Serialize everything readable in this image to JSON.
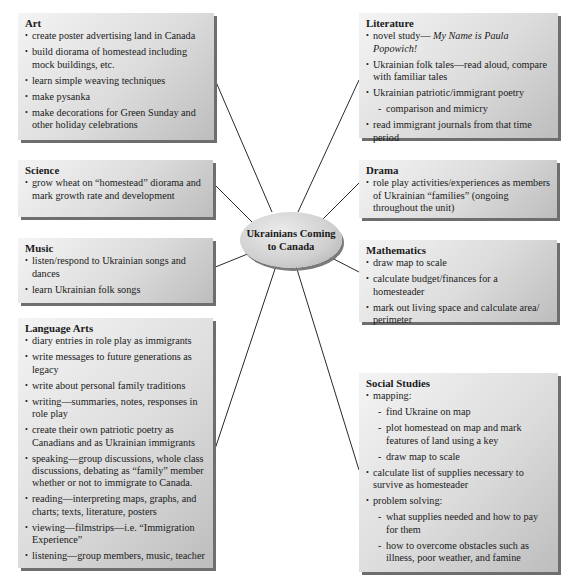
{
  "center": {
    "title": "Ukrainians Coming to Canada"
  },
  "boxes": {
    "art": {
      "title": "Art",
      "items": [
        "create poster advertising land in Canada",
        "build diorama of homestead including mock buildings, etc.",
        "learn simple weaving techniques",
        "make pysanka",
        "make decorations for Green Sunday and other holiday celebrations"
      ]
    },
    "science": {
      "title": "Science",
      "items": [
        "grow wheat on “homestead” diorama and mark growth rate and development"
      ]
    },
    "music": {
      "title": "Music",
      "items": [
        "listen/respond to Ukrainian songs and dances",
        "learn Ukrainian folk songs"
      ]
    },
    "language_arts": {
      "title": "Language Arts",
      "items": [
        "diary entries in role play as immigrants",
        "write messages to future generations as legacy",
        "write about personal family traditions",
        "writing—summaries, notes, responses in role play",
        "create their own patriotic poetry as Canadians and as Ukrainian immigrants",
        "speaking—group discussions, whole class discussions, debating as “family” member whether or not to immigrate to Canada.",
        "reading—interpreting maps, graphs, and charts; texts, literature, posters",
        "viewing—filmstrips—i.e. “Immigration Experience”",
        "listening—group members, music, teacher"
      ]
    },
    "literature": {
      "title": "Literature",
      "item0_prefix": "novel study— ",
      "item0_italic": "My Name is Paula Popowich!",
      "items": [
        "Ukrainian folk tales—read aloud, compare with familiar tales",
        "Ukrainian patriotic/immigrant poetry",
        "comparison and mimicry",
        "read immigrant journals from that time period"
      ]
    },
    "drama": {
      "title": "Drama",
      "items": [
        "role play activities/experiences as members of Ukrainian “families” (ongoing throughout the unit)"
      ]
    },
    "mathematics": {
      "title": "Mathematics",
      "items": [
        "draw map to scale",
        "calculate budget/finances for a homesteader",
        "mark out living space and calculate area/ perimeter"
      ]
    },
    "social_studies": {
      "title": "Social Studies",
      "items": [
        "mapping:",
        "find Ukraine on map",
        "plot homestead on map and mark features of land using a key",
        "draw map to scale",
        "calculate list of supplies necessary to survive as homesteader",
        "problem solving:",
        "what supplies needed and how to pay for them",
        "how to overcome obstacles such as illness, poor weather, and famine"
      ]
    }
  },
  "colors": {
    "line": "#2a2a2a",
    "shadow": "#6e6e6e"
  }
}
